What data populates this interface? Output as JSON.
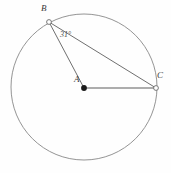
{
  "figure": {
    "type": "circle-inscribed-angle-diagram",
    "background_color": "#fefefe",
    "stroke_color": "#6e6e6e",
    "radius_stroke_color": "#a8a8a8",
    "chord_stroke_color": "#5a5a5a",
    "label_color": "#3a3a3a",
    "circle": {
      "center_label": "A",
      "center_x": 84,
      "center_y": 87,
      "radius": 73
    },
    "points": [
      {
        "id": "B",
        "label": "B",
        "marker": "open-circle",
        "x": 49,
        "y": 22
      },
      {
        "id": "A",
        "label": "A",
        "marker": "filled-dot",
        "x": 84,
        "y": 88
      },
      {
        "id": "C",
        "label": "C",
        "marker": "open-circle",
        "x": 156,
        "y": 88
      }
    ],
    "segments": [
      {
        "id": "BA",
        "from": "B",
        "to": "A",
        "style": "thin-dark"
      },
      {
        "id": "BC",
        "from": "B",
        "to": "C",
        "style": "thin-dark"
      },
      {
        "id": "AC",
        "from": "A",
        "to": "C",
        "style": "thick-gray-radius"
      }
    ],
    "angles": [
      {
        "id": "ABC",
        "vertex": "B",
        "value": "31",
        "unit": "°",
        "text": "31°"
      }
    ]
  }
}
